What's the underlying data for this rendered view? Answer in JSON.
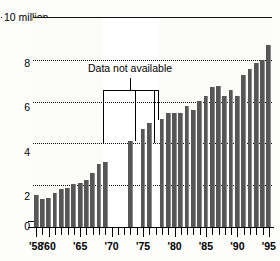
{
  "chart_data": {
    "type": "bar",
    "title": "",
    "subtitle": "",
    "unit_label": "10 million",
    "xlabel": "",
    "ylabel": "",
    "ylim": [
      0,
      10
    ],
    "yticks": [
      0,
      2,
      4,
      6,
      8,
      10
    ],
    "ytick_labels": [
      "0",
      "2",
      "4",
      "6",
      "8",
      "10 million"
    ],
    "grid": true,
    "grid_style": "dotted-horizontal",
    "legend": "none",
    "bar_color": "#565656",
    "background_color": "#fbfbf8",
    "axis_color": "#000000",
    "xlim_years": [
      1958,
      1995
    ],
    "xtick_labels": [
      "'58",
      "'60",
      "'65",
      "'70",
      "'75",
      "'80",
      "'85",
      "'90",
      "'95"
    ],
    "xtick_years": [
      1958,
      1960,
      1965,
      1970,
      1975,
      1980,
      1985,
      1990,
      1995
    ],
    "annotations": [
      {
        "text": "Data not available",
        "type": "bracket",
        "span_years": [
          1969,
          1977
        ],
        "missing_years": [
          1969,
          1970,
          1971,
          1972,
          1974,
          1977
        ]
      }
    ],
    "categories": [
      "1958",
      "1959",
      "1960",
      "1961",
      "1962",
      "1963",
      "1964",
      "1965",
      "1966",
      "1967",
      "1968",
      "1969",
      "1970",
      "1971",
      "1972",
      "1973",
      "1974",
      "1975",
      "1976",
      "1977",
      "1978",
      "1979",
      "1980",
      "1981",
      "1982",
      "1983",
      "1984",
      "1985",
      "1986",
      "1987",
      "1988",
      "1989",
      "1990",
      "1991",
      "1992",
      "1993",
      "1994",
      "1995"
    ],
    "values": [
      1.55,
      1.35,
      1.4,
      1.65,
      1.8,
      1.85,
      2.05,
      2.1,
      2.25,
      2.6,
      3.0,
      3.1,
      null,
      null,
      null,
      4.1,
      null,
      4.7,
      5.0,
      null,
      5.15,
      5.45,
      5.45,
      5.45,
      5.8,
      5.6,
      6.05,
      6.25,
      6.7,
      6.75,
      6.25,
      6.55,
      6.25,
      7.25,
      7.55,
      7.85,
      8.0,
      8.7
    ]
  }
}
